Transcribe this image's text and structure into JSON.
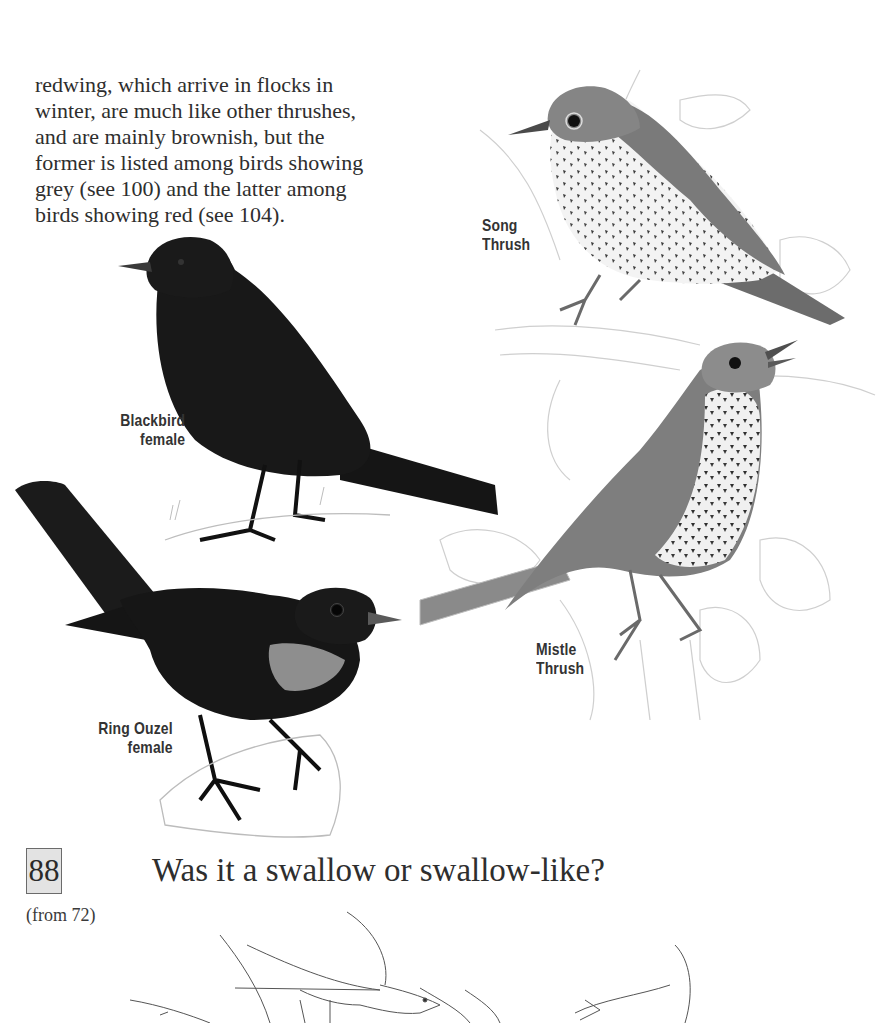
{
  "page": {
    "intro_paragraph": {
      "lines": [
        "redwing, which arrive in flocks in",
        "winter, are much like other thrushes,",
        "and are mainly brownish, but the",
        "former is listed among birds showing",
        "grey (see 100) and the latter among",
        "birds showing red (see 104)."
      ]
    },
    "illustrations": [
      {
        "id": "song-thrush",
        "caption_line1": "Song",
        "caption_line2": "Thrush"
      },
      {
        "id": "blackbird-female",
        "caption_line1": "Blackbird",
        "caption_line2": "female"
      },
      {
        "id": "mistle-thrush",
        "caption_line1": "Mistle",
        "caption_line2": "Thrush"
      },
      {
        "id": "ring-ouzel-female",
        "caption_line1": "Ring Ouzel",
        "caption_line2": "female"
      }
    ],
    "section": {
      "number": "88",
      "title": "Was it a swallow or swallow-like?",
      "from_ref": "(from 72)"
    },
    "colors": {
      "text": "#2e2e2e",
      "caption": "#333333",
      "section_box_bg": "#e3e3e3",
      "section_box_border": "#6b6b6b",
      "blackbird": "#161616",
      "thrush_back": "#7d7d7d",
      "thrush_belly": "#f2f2f2",
      "sketch_line": "#c8c8c8"
    }
  }
}
